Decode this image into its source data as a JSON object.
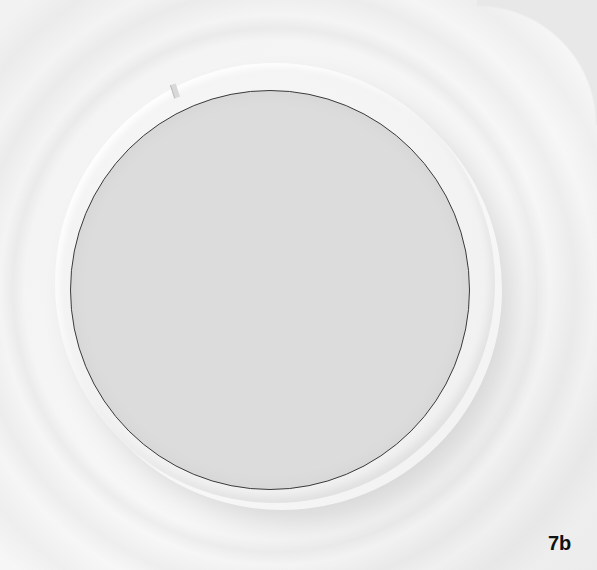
{
  "figure": {
    "label": "7b",
    "colors": {
      "background": "#f4f4f4",
      "ring": "#f1f1f1",
      "disc": "#dcdcdc",
      "outline": "#3a3a3a"
    }
  }
}
